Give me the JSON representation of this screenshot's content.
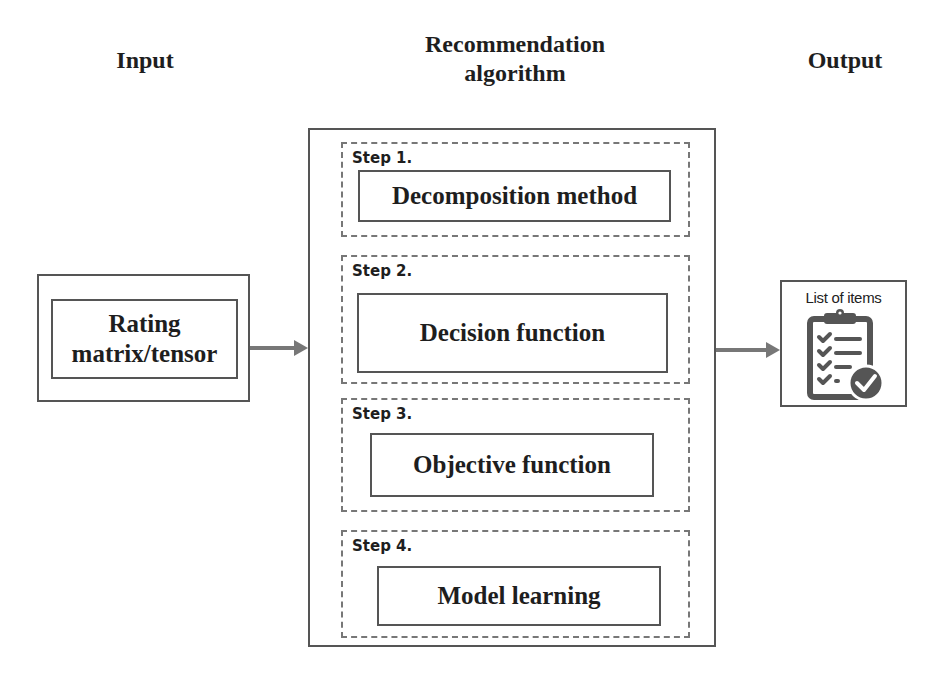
{
  "columns": {
    "input_title": "Input",
    "algorithm_title_line1": "Recommendation",
    "algorithm_title_line2": "algorithm",
    "output_title": "Output"
  },
  "input": {
    "line1": "Rating",
    "line2": "matrix/tensor"
  },
  "steps": [
    {
      "label": "Step 1.",
      "name": "Decomposition method"
    },
    {
      "label": "Step 2.",
      "name": "Decision function"
    },
    {
      "label": "Step 3.",
      "name": "Objective function"
    },
    {
      "label": "Step 4.",
      "name": "Model learning"
    }
  ],
  "output": {
    "label": "List of items",
    "icon": "clipboard-checklist-icon"
  },
  "colors": {
    "line": "#555555",
    "arrow": "#777777",
    "icon": "#555555"
  }
}
